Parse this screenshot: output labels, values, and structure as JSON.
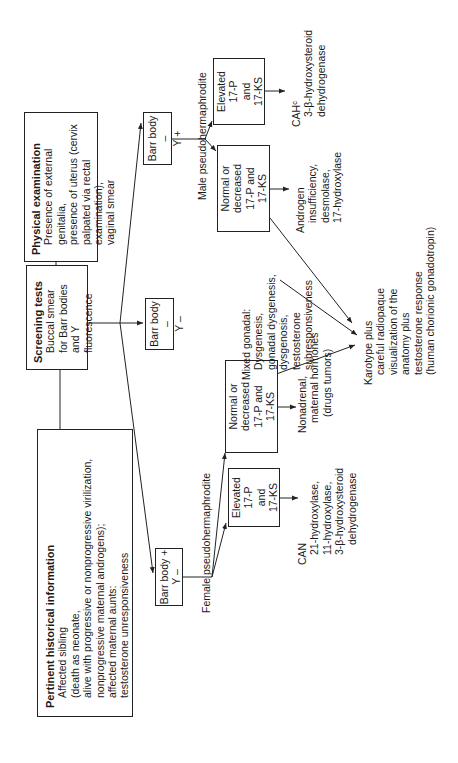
{
  "pertinent": {
    "title": "Pertinent historical information",
    "lines": [
      "Affected sibling",
      "(death as neonate,",
      "alive with progressive or nonprogressive virilization,",
      "nonprogressive maternal androgens);",
      "affected maternal aunts:",
      "testosterone unresponsiveness"
    ]
  },
  "screening": {
    "title": "Screening tests",
    "lines": [
      "Buccal smear",
      "for Barr bodies",
      "and Y fluorescence"
    ]
  },
  "physical": {
    "title": "Physical examination",
    "lines": [
      "Presence of external genitalia,",
      "presence of uterus (cervix",
      "palpated via rectal examination),",
      "vaginal smear"
    ]
  },
  "barr_pos_y_neg": {
    "line1": "Barr body  +",
    "line2": "Y  –"
  },
  "barr_neg_y_neg": {
    "line1": "Barr body  –",
    "line2": "Y  –"
  },
  "barr_neg_y_pos": {
    "line1": "Barr body  –",
    "line2": "Y  +"
  },
  "female": {
    "label": "Female pseudohermaphrodite",
    "elevated": [
      "Elevated",
      "17-P",
      "and",
      "17-KS"
    ],
    "normal": [
      "Normal or",
      "decreased",
      "17-P and",
      "17-KS"
    ],
    "can": {
      "title": "CAN",
      "lines": [
        "21-hydroxylase,",
        "11-hydroxylase,",
        "3-β-hydroxysteroid",
        "dehydrogenase"
      ]
    },
    "nonadrenal": [
      "Nonadrenal,",
      "maternal hormones",
      "(drugs tumors)"
    ]
  },
  "male": {
    "label": "Male pseudohermaphrodite",
    "normal": [
      "Normal or",
      "decreased",
      "17-P and",
      "17-KS"
    ],
    "elevated": [
      "Elevated",
      "17-P",
      "and",
      "17-KS"
    ],
    "androgen": [
      "Androgen",
      "insufficiency,",
      "desmolase,",
      "17-hydroxylase"
    ],
    "cah": {
      "title": "CAHᶜ",
      "lines": [
        "3-β-hydroxysteroid",
        "dehydrogenase"
      ]
    }
  },
  "mixed": {
    "title": "Mixed gonadal:",
    "lines": [
      "Dysgenesis,",
      "gonadal dysgenesis,",
      "dysgenosis,",
      "testosterone",
      "subresponsiveness"
    ]
  },
  "karyotype": {
    "lines": [
      "Karotype plus",
      "careful radiopaque",
      "visualization of the",
      "anatomy plus",
      "testosterone response",
      "(human chorionic gonadotropin)"
    ]
  }
}
